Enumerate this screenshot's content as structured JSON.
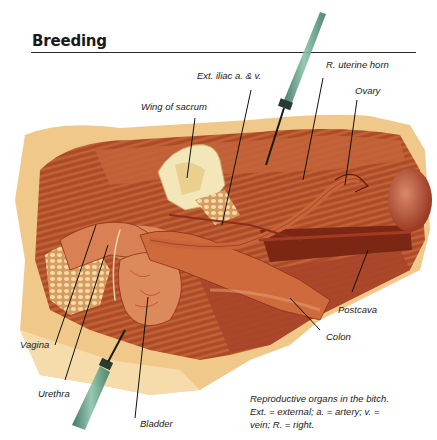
{
  "page": {
    "title": "Breeding"
  },
  "figure": {
    "labels": {
      "ext_iliac": "Ext. iliac a. & v.",
      "r_uterine_horn": "R. uterine horn",
      "ovary": "Ovary",
      "wing_of_sacrum": "Wing of sacrum",
      "postcava": "Postcava",
      "colon": "Colon",
      "vagina": "Vagina",
      "urethra": "Urethra",
      "bladder": "Bladder"
    },
    "caption": {
      "line1": "Reproductive organs in the bitch.",
      "line2": "Ext. = external; a. = artery; v. =",
      "line3": "vein; R. = right."
    },
    "colors": {
      "skin": "#f0c98a",
      "muscle": "#b8502e",
      "muscle_dark": "#8a2f1a",
      "organ": "#d9703f",
      "fat": "#f3e6b8",
      "instrument": "#5e9a82"
    }
  }
}
